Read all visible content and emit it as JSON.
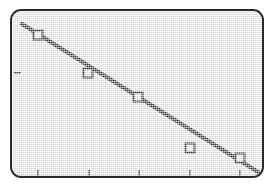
{
  "device": {
    "screen_kind": "graphing-calculator-lcd",
    "screen_background": "#e9e9e9",
    "bezel_color": "#2b2b2b",
    "ink_color": "#1a1a1a"
  },
  "chart_data": {
    "type": "scatter",
    "title": "",
    "subtitle": "",
    "xlabel": "",
    "ylabel": "",
    "grid": false,
    "legend": null,
    "legend_position": "none",
    "axis_tick_labels_shown": false,
    "xlim": [
      0,
      6
    ],
    "ylim": [
      0,
      6
    ],
    "x": [
      1,
      2,
      3,
      4,
      5
    ],
    "y": [
      5.2,
      4.35,
      3.6,
      1.95,
      1.55
    ],
    "series": [
      {
        "name": "data points",
        "marker": "open-square",
        "marker_size_px": 9,
        "x": [
          1,
          2,
          3,
          4,
          5
        ],
        "y": [
          5.2,
          4.35,
          3.6,
          1.95,
          1.55
        ]
      }
    ],
    "fit_line": {
      "name": "linear regression line",
      "trend": "negative",
      "x_endpoints": [
        0.68,
        5.38
      ],
      "y_endpoints": [
        5.66,
        1.28
      ],
      "slope": -0.93,
      "intercept": 6.29
    },
    "x_ticks": [
      1,
      2,
      3,
      4,
      5
    ],
    "y_ticks": [
      4.35
    ],
    "points_px": [
      {
        "cx": 38,
        "cy": 35
      },
      {
        "cx": 88,
        "cy": 73
      },
      {
        "cx": 138,
        "cy": 97
      },
      {
        "cx": 190,
        "cy": 148
      },
      {
        "cx": 240,
        "cy": 158
      }
    ],
    "x_ticks_px": [
      38,
      89,
      139,
      190,
      240
    ],
    "y_ticks_px": [
      73
    ],
    "fit_line_px": {
      "x1": 22,
      "y1": 24,
      "x2": 258,
      "y2": 172
    }
  }
}
